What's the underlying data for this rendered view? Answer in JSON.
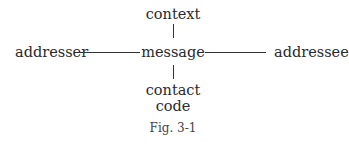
{
  "diagram": {
    "nodes": {
      "context": "context",
      "addresser": "addresser",
      "message": "message",
      "addressee": "addressee",
      "contact": "contact",
      "code": "code"
    },
    "edges": [
      {
        "from": "context",
        "to": "message"
      },
      {
        "from": "addresser",
        "to": "message"
      },
      {
        "from": "message",
        "to": "addressee"
      },
      {
        "from": "message",
        "to": "contact"
      }
    ],
    "caption": "Fig. 3-1"
  }
}
